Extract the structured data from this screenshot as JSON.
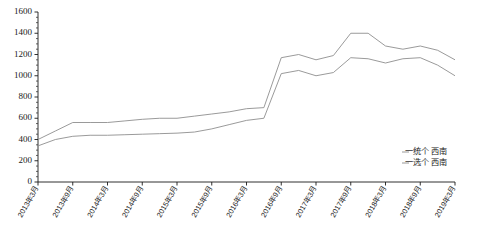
{
  "chart_data": {
    "type": "line",
    "title": "",
    "xlabel": "",
    "ylabel": "",
    "ylim": [
      0,
      1600
    ],
    "y_ticks": [
      0,
      200,
      400,
      600,
      800,
      1000,
      1200,
      1400,
      1600
    ],
    "y_minor_step": 50,
    "grid": false,
    "legend_position": "bottom-right",
    "categories": [
      "2013年3月",
      "2013年6月",
      "2013年9月",
      "2013年12月",
      "2014年3月",
      "2014年6月",
      "2014年9月",
      "2014年12月",
      "2015年3月",
      "2015年6月",
      "2015年9月",
      "2015年12月",
      "2016年3月",
      "2016年6月",
      "2016年9月",
      "2016年12月",
      "2017年3月",
      "2017年6月",
      "2017年9月",
      "2017年12月",
      "2018年3月",
      "2018年6月",
      "2018年9月",
      "2018年12月",
      "2019年3月"
    ],
    "x_tick_labels": [
      "2013年3月",
      "2013年9月",
      "2014年3月",
      "2014年9月",
      "2015年3月",
      "2015年9月",
      "2016年3月",
      "2016年9月",
      "2017年3月",
      "2017年9月",
      "2018年3月",
      "2018年9月",
      "2019年3月"
    ],
    "series": [
      {
        "name": "一统个  西南",
        "color": "#8f8f8f",
        "values": [
          400,
          480,
          560,
          560,
          560,
          575,
          590,
          600,
          600,
          620,
          640,
          660,
          690,
          700,
          1170,
          1200,
          1150,
          1190,
          1400,
          1400,
          1280,
          1250,
          1280,
          1240,
          1150
        ]
      },
      {
        "name": "一选个  西南",
        "color": "#8f8f8f",
        "values": [
          340,
          400,
          430,
          440,
          440,
          445,
          450,
          455,
          460,
          470,
          500,
          540,
          580,
          600,
          1020,
          1050,
          1000,
          1030,
          1170,
          1160,
          1120,
          1160,
          1170,
          1100,
          1000
        ]
      }
    ],
    "detailed_points": {
      "note": "step-like monthly series; plateaus at ~560-600 (2013-2015), ~800 (2015-2016), jump to ~1200 mid-2016, peak ~1400 in 2017, settling ~1150 by 2019"
    }
  },
  "legend": {
    "items": [
      {
        "label": "一统个  西南"
      },
      {
        "label": "一选个  西南"
      }
    ]
  },
  "axes": {
    "y_labels": [
      "1600",
      "1400",
      "1200",
      "1000",
      "800",
      "600",
      "400",
      "200",
      "0"
    ],
    "x_labels": [
      "2013年3月",
      "2013年9月",
      "2014年3月",
      "2014年9月",
      "2015年3月",
      "2015年9月",
      "2016年3月",
      "2016年9月",
      "2017年3月",
      "2017年9月",
      "2018年3月",
      "2018年9月",
      "2019年3月"
    ]
  }
}
